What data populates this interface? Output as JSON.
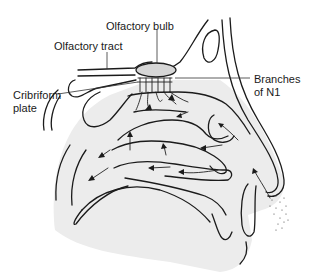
{
  "figure": {
    "labels": {
      "olfactory_bulb": "Olfactory bulb",
      "olfactory_tract": "Olfactory tract",
      "cribriform_plate_line1": "Cribriform",
      "cribriform_plate_line2": "plate",
      "branches_line1": "Branches",
      "branches_line2": "of N1"
    },
    "colors": {
      "line": "#1b1b1b",
      "tissue_fill": "#e9e9e9",
      "bulb_fill": "#d6d6d6",
      "background": "#ffffff"
    }
  }
}
